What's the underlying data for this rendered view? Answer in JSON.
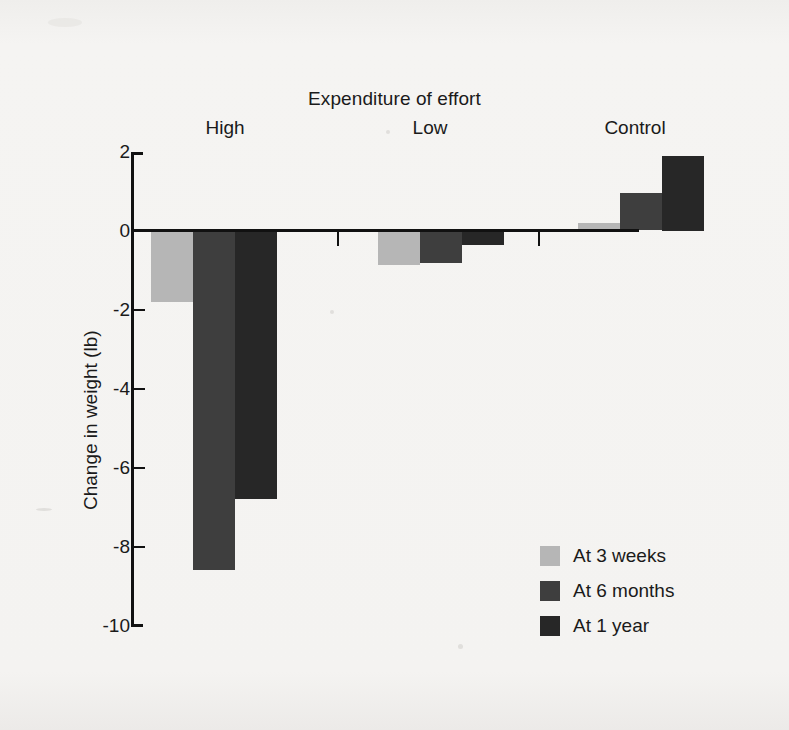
{
  "chart_data": {
    "type": "bar",
    "title": "Expenditure of effort",
    "xlabel": "",
    "ylabel": "Change in weight (lb)",
    "categories": [
      "High",
      "Low",
      "Control"
    ],
    "series": [
      {
        "name": "At 3 weeks",
        "values": [
          -1.8,
          -0.85,
          0.2
        ],
        "color": "#b6b6b6"
      },
      {
        "name": "At 6 months",
        "values": [
          -8.6,
          -0.8,
          0.95
        ],
        "color": "#3e3e3e"
      },
      {
        "name": "At 1 year",
        "values": [
          -6.8,
          -0.35,
          1.9
        ],
        "color": "#272727"
      }
    ],
    "ylim": [
      -10,
      2
    ],
    "yticks": [
      2,
      0,
      -2,
      -4,
      -6,
      -8,
      -10
    ],
    "ytick_labels": [
      "2",
      "0",
      "-2",
      "-4",
      "-6",
      "-8",
      "-10"
    ],
    "grid": false,
    "legend_position": "lower-right",
    "zero_line": 0
  },
  "legend": {
    "entries": [
      {
        "label": "At 3 weeks",
        "color": "#b6b6b6"
      },
      {
        "label": "At 6 months",
        "color": "#3e3e3e"
      },
      {
        "label": "At 1 year",
        "color": "#272727"
      }
    ]
  },
  "axis": {
    "y_label": "Change in weight (lb)",
    "ticks": [
      "2",
      "0",
      "-2",
      "-4",
      "-6",
      "-8",
      "-10"
    ]
  },
  "groups": [
    {
      "label": "High"
    },
    {
      "label": "Low"
    },
    {
      "label": "Control"
    }
  ],
  "title": {
    "text": "Expenditure of effort"
  },
  "colors": {
    "background": "#f4f3f1",
    "axis": "#111111",
    "text": "#1a1a1a",
    "series_light": "#b6b6b6",
    "series_medium": "#3e3e3e",
    "series_dark": "#272727"
  }
}
